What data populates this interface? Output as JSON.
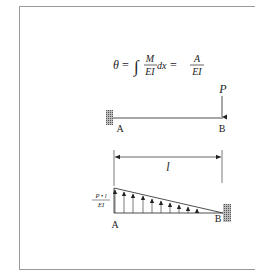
{
  "equation": {
    "lhs": "θ",
    "eq1": "=",
    "integral": "∫",
    "frac1_num": "M",
    "frac1_den": "EI",
    "dx": "dx",
    "eq2": "=",
    "frac2_num": "A",
    "frac2_den": "EI"
  },
  "beam": {
    "load_label": "P",
    "left_label": "A",
    "right_label": "B"
  },
  "diagram": {
    "dimension_label": "l",
    "max_value_num": "P • l",
    "max_value_den": "EI",
    "left_label": "A",
    "right_label": "B",
    "arrow_count": 10
  }
}
